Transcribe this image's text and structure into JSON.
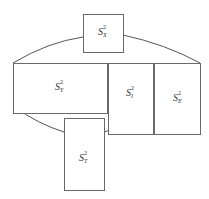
{
  "diagram": {
    "type": "variance-decomposition-block-diagram",
    "line_color": "#6a6a6a",
    "background": "#ffffff",
    "blocks": [
      {
        "id": "sx",
        "symbol": "S",
        "sup": "2",
        "sub": "X",
        "x": 83,
        "y": 14,
        "w": 40,
        "h": 38
      },
      {
        "id": "sy",
        "symbol": "S",
        "sup": "2",
        "sub": "Y",
        "x": 13,
        "y": 63,
        "w": 94,
        "h": 50
      },
      {
        "id": "si",
        "symbol": "S",
        "sup": "2",
        "sub": "I",
        "x": 108,
        "y": 63,
        "w": 45,
        "h": 71
      },
      {
        "id": "se",
        "symbol": "S",
        "sup": "2",
        "sub": "E",
        "x": 154,
        "y": 63,
        "w": 46,
        "h": 71
      },
      {
        "id": "st",
        "symbol": "S",
        "sup": "2",
        "sub": "T",
        "x": 64,
        "y": 118,
        "w": 40,
        "h": 72
      }
    ],
    "connectors": [
      {
        "id": "arc-top-left",
        "from": "sy",
        "to": "sx"
      },
      {
        "id": "arc-top-right",
        "from": "sx",
        "to": "se"
      },
      {
        "id": "arc-bottom-left",
        "from": "sy",
        "to": "st"
      },
      {
        "id": "arc-bottom-right",
        "from": "st",
        "to": "si"
      }
    ]
  }
}
